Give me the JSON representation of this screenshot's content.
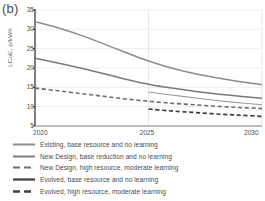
{
  "figure": {
    "panel_label": "(b)",
    "ylabel": "LCoE, p/kWh"
  },
  "axis": {
    "yticks": [
      "35",
      "30",
      "25",
      "20",
      "15",
      "10",
      "5"
    ],
    "xticks": [
      "2020",
      "2025",
      "2030"
    ]
  },
  "legend": {
    "items": [
      {
        "label": "Existing, base resource and no learning",
        "style": "solid",
        "color": "#8c8c8c",
        "width": 2.0
      },
      {
        "label": "New Design, base reduction and no learning",
        "style": "solid",
        "color": "#7a7a7a",
        "width": 2.0
      },
      {
        "label": "New Design, high resource, moderate learning",
        "style": "dashed",
        "color": "#6f6f6f",
        "width": 2.0
      },
      {
        "label": "Evolved, base resource and no learning",
        "style": "solid",
        "color": "#4a4a4a",
        "width": 2.4
      },
      {
        "label": "Evolved, high resource, moderate learning",
        "style": "dashed",
        "color": "#3f3f3f",
        "width": 2.4
      }
    ]
  },
  "chart_data": {
    "type": "line",
    "title": "(b)",
    "xlabel": "",
    "ylabel": "LCoE, p/kWh",
    "xlim": [
      2020,
      2030
    ],
    "ylim": [
      5,
      35
    ],
    "ytick_values": [
      5,
      10,
      15,
      20,
      25,
      30,
      35
    ],
    "xtick_values": [
      2020,
      2025,
      2030
    ],
    "grid": "horizontal-and-vertical-faint",
    "legend_position": "below-plot",
    "series": [
      {
        "name": "Existing, base resource and no learning",
        "style": "solid",
        "color": "#8c8c8c",
        "x": [
          2020,
          2021,
          2022,
          2023,
          2024,
          2025,
          2026,
          2027,
          2028,
          2029,
          2030
        ],
        "y": [
          32.0,
          30.4,
          28.5,
          26.3,
          24.0,
          21.8,
          20.0,
          18.6,
          17.5,
          16.5,
          15.7
        ]
      },
      {
        "name": "New Design, base reduction and no learning",
        "style": "solid",
        "color": "#7a7a7a",
        "x": [
          2020,
          2021,
          2022,
          2023,
          2024,
          2025,
          2026,
          2027,
          2028,
          2029,
          2030
        ],
        "y": [
          22.5,
          21.3,
          20.0,
          18.6,
          17.1,
          15.8,
          14.8,
          14.0,
          13.3,
          12.7,
          12.2
        ]
      },
      {
        "name": "New Design, high resource, moderate learning",
        "style": "dashed",
        "color": "#6f6f6f",
        "x": [
          2020,
          2021,
          2022,
          2023,
          2024,
          2025,
          2026,
          2027,
          2028,
          2029,
          2030
        ],
        "y": [
          14.8,
          14.1,
          13.4,
          12.7,
          12.0,
          11.4,
          10.9,
          10.5,
          10.1,
          9.8,
          9.5
        ]
      },
      {
        "name": "Evolved, base resource and no learning",
        "style": "solid",
        "color": "#9a9a9a",
        "x": [
          2025,
          2026,
          2027,
          2028,
          2029,
          2030
        ],
        "y": [
          13.8,
          13.0,
          12.3,
          11.6,
          11.0,
          10.5
        ]
      },
      {
        "name": "Evolved, high resource, moderate learning",
        "style": "dashed",
        "color": "#3f3f3f",
        "x": [
          2025,
          2026,
          2027,
          2028,
          2029,
          2030
        ],
        "y": [
          9.4,
          8.9,
          8.5,
          8.1,
          7.8,
          7.5
        ]
      }
    ]
  }
}
